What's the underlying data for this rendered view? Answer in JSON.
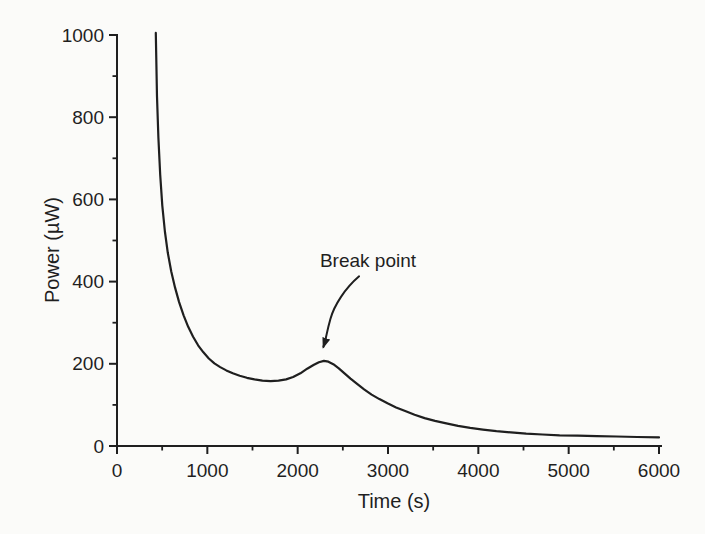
{
  "figure": {
    "background": "#fbfbf9",
    "ink": "#1f1f1f"
  },
  "chart_data": {
    "type": "line",
    "title": "",
    "xlabel": "Time (s)",
    "ylabel": "Power (µW)",
    "xlim": [
      0,
      6000
    ],
    "ylim": [
      0,
      1000
    ],
    "x_major_ticks": [
      0,
      1000,
      2000,
      3000,
      4000,
      5000,
      6000
    ],
    "x_minor_ticks": [
      500,
      1500,
      2500,
      3500,
      4500,
      5500
    ],
    "y_major_ticks": [
      0,
      200,
      400,
      600,
      800,
      1000
    ],
    "y_minor_ticks": [
      100,
      300,
      500,
      700,
      900
    ],
    "grid": false,
    "legend": "none",
    "line_color": "#1f1f1f",
    "annotation": {
      "text": "Break point",
      "label_x": 2780,
      "label_y": 434,
      "arrow_from_x": 2680,
      "arrow_from_y": 413,
      "arrow_to_x": 2285,
      "arrow_to_y": 241,
      "points_at_x": 2290,
      "points_at_y": 207
    },
    "series": [
      {
        "name": "power",
        "points": [
          [
            430,
            1005
          ],
          [
            443,
            850
          ],
          [
            458,
            750
          ],
          [
            478,
            660
          ],
          [
            502,
            585
          ],
          [
            530,
            522
          ],
          [
            562,
            470
          ],
          [
            600,
            425
          ],
          [
            642,
            386
          ],
          [
            688,
            350
          ],
          [
            737,
            318
          ],
          [
            788,
            290
          ],
          [
            842,
            266
          ],
          [
            898,
            245
          ],
          [
            956,
            228
          ],
          [
            1016,
            213
          ],
          [
            1078,
            201
          ],
          [
            1142,
            192
          ],
          [
            1210,
            184
          ],
          [
            1282,
            177
          ],
          [
            1358,
            171
          ],
          [
            1438,
            166
          ],
          [
            1522,
            162
          ],
          [
            1610,
            159
          ],
          [
            1700,
            158
          ],
          [
            1788,
            159
          ],
          [
            1872,
            162
          ],
          [
            1950,
            168
          ],
          [
            2030,
            177
          ],
          [
            2105,
            188
          ],
          [
            2175,
            197
          ],
          [
            2235,
            204
          ],
          [
            2290,
            207
          ],
          [
            2340,
            205
          ],
          [
            2395,
            199
          ],
          [
            2455,
            189
          ],
          [
            2518,
            177
          ],
          [
            2585,
            164
          ],
          [
            2658,
            151
          ],
          [
            2735,
            138
          ],
          [
            2818,
            125
          ],
          [
            2905,
            114
          ],
          [
            2995,
            104
          ],
          [
            3090,
            94
          ],
          [
            3190,
            85
          ],
          [
            3295,
            76
          ],
          [
            3405,
            68
          ],
          [
            3520,
            61
          ],
          [
            3645,
            55
          ],
          [
            3775,
            49
          ],
          [
            3910,
            44
          ],
          [
            4050,
            40
          ],
          [
            4200,
            36
          ],
          [
            4360,
            33
          ],
          [
            4530,
            30
          ],
          [
            4710,
            28
          ],
          [
            4900,
            26
          ],
          [
            5100,
            25
          ],
          [
            5310,
            24
          ],
          [
            5530,
            23
          ],
          [
            5760,
            22
          ],
          [
            6000,
            21
          ]
        ]
      }
    ]
  }
}
